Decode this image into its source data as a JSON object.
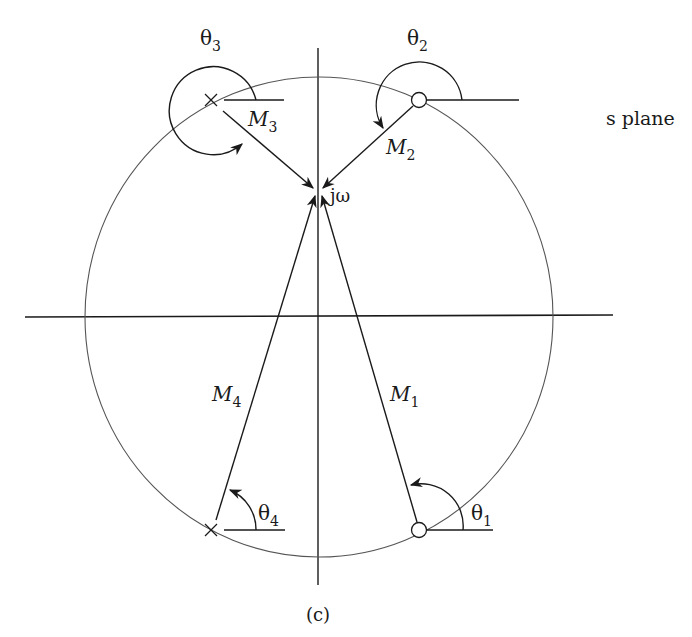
{
  "figure": {
    "caption": "(c)",
    "plane_label": "s plane",
    "point_label": "jω",
    "colors": {
      "stroke": "#1a1a1a",
      "circle": "#555555",
      "background": "#ffffff"
    }
  },
  "poles": [
    {
      "id": "pole-3",
      "marker": "×",
      "x": 211,
      "y": 100,
      "vector_label": "M",
      "vector_sub": "3",
      "angle_label": "θ",
      "angle_sub": "3"
    },
    {
      "id": "pole-4",
      "marker": "×",
      "x": 211,
      "y": 530,
      "vector_label": "M",
      "vector_sub": "4",
      "angle_label": "θ",
      "angle_sub": "4"
    }
  ],
  "zeros": [
    {
      "id": "zero-2",
      "marker": "○",
      "x": 419,
      "y": 100,
      "vector_label": "M",
      "vector_sub": "2",
      "angle_label": "θ",
      "angle_sub": "2"
    },
    {
      "id": "zero-1",
      "marker": "○",
      "x": 419,
      "y": 530,
      "vector_label": "M",
      "vector_sub": "1",
      "angle_label": "θ",
      "angle_sub": "1"
    }
  ],
  "labels": {
    "theta3": {
      "base": "θ",
      "sub": "3"
    },
    "theta2": {
      "base": "θ",
      "sub": "2"
    },
    "theta4": {
      "base": "θ",
      "sub": "4"
    },
    "theta1": {
      "base": "θ",
      "sub": "1"
    },
    "m3": {
      "base": "M",
      "sub": "3"
    },
    "m2": {
      "base": "M",
      "sub": "2"
    },
    "m4": {
      "base": "M",
      "sub": "4"
    },
    "m1": {
      "base": "M",
      "sub": "1"
    }
  }
}
